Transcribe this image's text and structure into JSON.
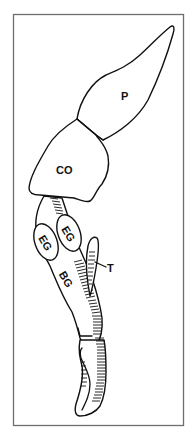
{
  "figure": {
    "type": "anatomical line drawing",
    "frame_color": "#6e6e6e",
    "stroke_color": "#111111",
    "background": "#ffffff",
    "labels": {
      "p": "P",
      "co": "CO",
      "eg_left": "EG",
      "eg_right": "EG",
      "bg": "BG",
      "t": "T"
    },
    "parts": [
      {
        "id": "p",
        "label": "P",
        "description": "elongated distal lobe, top"
      },
      {
        "id": "co",
        "label": "CO",
        "description": "block-shaped segment below P"
      },
      {
        "id": "eg",
        "label": "EG",
        "description": "two oval glands on the stalk",
        "count": 2
      },
      {
        "id": "bg",
        "label": "BG",
        "description": "long hatched tubular body"
      },
      {
        "id": "t",
        "label": "T",
        "description": "finger-like hatched process, with leader line"
      }
    ]
  }
}
